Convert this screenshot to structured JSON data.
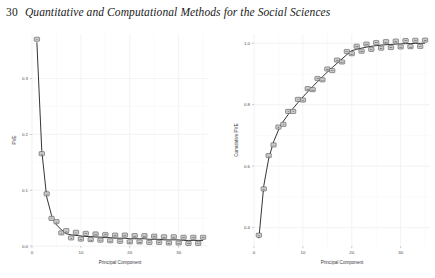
{
  "page": {
    "number": "30",
    "running_title": "Quantitative and Computational Methods for the Social Sciences"
  },
  "chart_data": [
    {
      "id": "pve",
      "type": "line",
      "title": "",
      "xlabel": "Principal Component",
      "ylabel": "PVE",
      "xlim": [
        0,
        36
      ],
      "ylim": [
        0.0,
        0.38
      ],
      "xticks": [
        0,
        10,
        20,
        30
      ],
      "xtick_labels": [
        "0",
        "10",
        "20",
        "30"
      ],
      "yticks": [
        0.0,
        0.1,
        0.2,
        0.3
      ],
      "ytick_labels": [
        "0.0",
        "0.1",
        "0.2",
        "0.3"
      ],
      "grid": true,
      "legend": "none",
      "marker_style": "labelled-square",
      "x": [
        1,
        2,
        3,
        4,
        5,
        6,
        7,
        8,
        9,
        10,
        11,
        12,
        13,
        14,
        15,
        16,
        17,
        18,
        19,
        20,
        21,
        22,
        23,
        24,
        25,
        26,
        27,
        28,
        29,
        30,
        31,
        32,
        33,
        34,
        35
      ],
      "values": [
        0.365,
        0.171,
        0.088,
        0.055,
        0.038,
        0.029,
        0.022,
        0.02,
        0.019,
        0.018,
        0.017,
        0.017,
        0.016,
        0.016,
        0.015,
        0.015,
        0.014,
        0.014,
        0.014,
        0.013,
        0.013,
        0.013,
        0.013,
        0.012,
        0.012,
        0.012,
        0.011,
        0.011,
        0.011,
        0.011,
        0.01,
        0.01,
        0.01,
        0.01,
        0.01
      ],
      "point_labels": [
        "1",
        "2",
        "3",
        "4",
        "5",
        "6",
        "7",
        "8",
        "9",
        "10",
        "11",
        "12",
        "13",
        "14",
        "15",
        "16",
        "17",
        "18",
        "19",
        "20",
        "21",
        "22",
        "23",
        "24",
        "25",
        "26",
        "27",
        "28",
        "29",
        "30",
        "31",
        "32",
        "33",
        "34",
        "35"
      ]
    },
    {
      "id": "cumulative-pve",
      "type": "line",
      "title": "",
      "xlabel": "Principal Component",
      "ylabel": "Cumulative PVE",
      "xlim": [
        0,
        36
      ],
      "ylim": [
        0.34,
        1.03
      ],
      "xticks": [
        0,
        10,
        20,
        30
      ],
      "xtick_labels": [
        "0",
        "10",
        "20",
        "30"
      ],
      "yticks": [
        0.4,
        0.6,
        0.8,
        1.0
      ],
      "ytick_labels": [
        "0.4",
        "0.6",
        "0.8",
        "1.0"
      ],
      "grid": true,
      "legend": "none",
      "marker_style": "labelled-square",
      "x": [
        1,
        2,
        3,
        4,
        5,
        6,
        7,
        8,
        9,
        10,
        11,
        12,
        13,
        14,
        15,
        16,
        17,
        18,
        19,
        20,
        21,
        22,
        23,
        24,
        25,
        26,
        27,
        28,
        29,
        30,
        31,
        32,
        33,
        34,
        35
      ],
      "values": [
        0.365,
        0.536,
        0.624,
        0.679,
        0.717,
        0.746,
        0.768,
        0.788,
        0.807,
        0.825,
        0.842,
        0.859,
        0.875,
        0.891,
        0.906,
        0.921,
        0.935,
        0.949,
        0.963,
        0.976,
        0.98,
        0.984,
        0.987,
        0.99,
        0.992,
        0.994,
        0.995,
        0.996,
        0.997,
        0.998,
        0.9985,
        0.999,
        0.9993,
        0.9996,
        1.0
      ],
      "point_labels": [
        "1",
        "2",
        "3",
        "4",
        "5",
        "6",
        "7",
        "8",
        "9",
        "10",
        "11",
        "12",
        "13",
        "14",
        "15",
        "16",
        "17",
        "18",
        "19",
        "20",
        "21",
        "22",
        "23",
        "24",
        "25",
        "26",
        "27",
        "28",
        "29",
        "30",
        "31",
        "32",
        "33",
        "34",
        "35"
      ]
    }
  ],
  "colors": {
    "line": "#111111",
    "marker_fill": "#c9c9c9",
    "marker_stroke": "#2e2e2e",
    "grid": "#e9e9ec",
    "background": "#ffffff",
    "text": "#1a1a1a"
  }
}
